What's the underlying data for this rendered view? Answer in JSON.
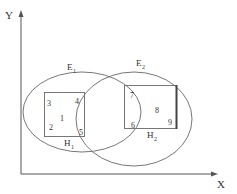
{
  "axes": {
    "x_label": "X",
    "y_label": "Y"
  },
  "ellipses": [
    {
      "name": "E1",
      "label": "E",
      "subscript": "1"
    },
    {
      "name": "E2",
      "label": "E",
      "subscript": "2"
    }
  ],
  "boxes": [
    {
      "name": "H1",
      "label": "H",
      "subscript": "1"
    },
    {
      "name": "H2",
      "label": "H",
      "subscript": "2"
    }
  ],
  "points": [
    "1",
    "2",
    "3",
    "4",
    "5",
    "6",
    "7",
    "8",
    "9"
  ],
  "colors": {
    "stroke": "#666666",
    "text": "#333333",
    "background": "#ffffff"
  }
}
